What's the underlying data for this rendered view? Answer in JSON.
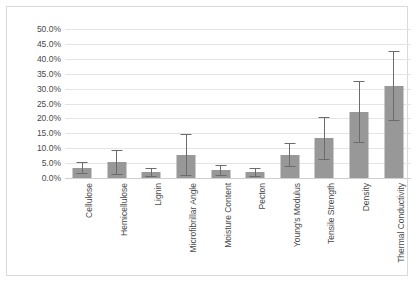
{
  "chart_data": {
    "type": "bar",
    "title": "",
    "xlabel": "",
    "ylabel": "",
    "ylim": [
      0,
      50
    ],
    "ytick_step": 5,
    "ytick_labels": [
      "50.0%",
      "45.0%",
      "40.0%",
      "35.0%",
      "30.0%",
      "25.0%",
      "20.0%",
      "15.0%",
      "10.0%",
      "5.0%",
      "0.0%"
    ],
    "ytick_values": [
      50,
      45,
      40,
      35,
      30,
      25,
      20,
      15,
      10,
      5,
      0
    ],
    "grid": "horizontal",
    "legend": "none",
    "bar_color": "#989898",
    "error_bar_color": "#6b6b6b",
    "gridline_color": "#e4e4e4",
    "frame_color": "#d9d9d9",
    "categories": [
      "Cellulose",
      "Hemicellulose",
      "Lignin",
      "Microfibrillar Angle",
      "Moisture Content",
      "Pecton",
      "Young's Modulus",
      "Tensile Strength",
      "Density",
      "Thermal Conductivity"
    ],
    "values": [
      3.4,
      5.3,
      2.0,
      7.8,
      2.6,
      2.0,
      7.7,
      13.4,
      22.2,
      30.9
    ],
    "errors": [
      2.1,
      4.2,
      1.5,
      7.0,
      1.9,
      1.5,
      4.0,
      7.2,
      10.3,
      11.8
    ],
    "error_upper": [
      5.5,
      9.5,
      3.5,
      14.8,
      4.5,
      3.5,
      11.7,
      20.6,
      32.5,
      42.7
    ],
    "error_lower": [
      1.3,
      1.1,
      0.5,
      0.8,
      0.7,
      0.5,
      3.7,
      6.2,
      11.9,
      19.1
    ],
    "units": "percent"
  }
}
